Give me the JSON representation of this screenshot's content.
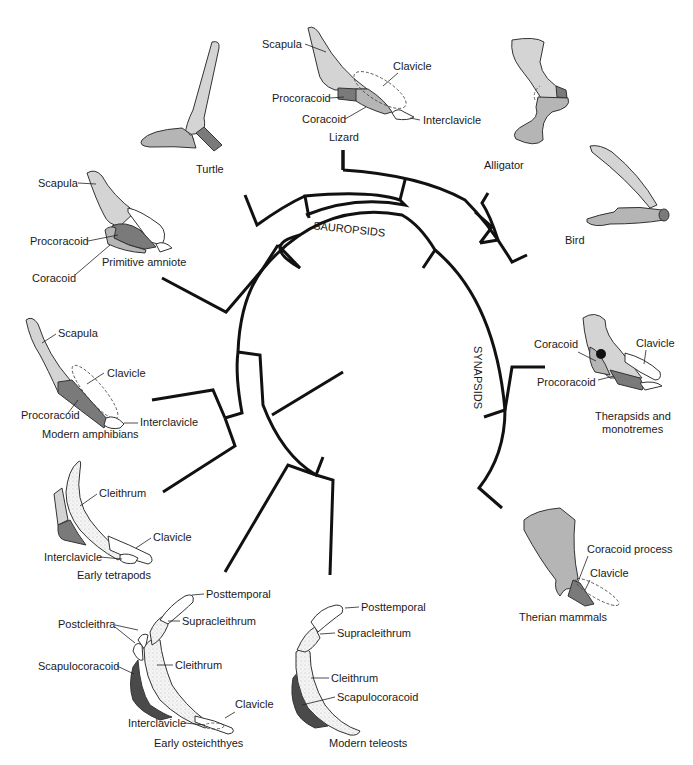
{
  "figure": {
    "clade_labels": {
      "sauropsids": "SAUROPSIDS",
      "synapsids": "SYNAPSIDS"
    },
    "taxa": {
      "turtle": {
        "name": "Turtle"
      },
      "lizard": {
        "name": "Lizard",
        "parts": {
          "scapula": "Scapula",
          "clavicle": "Clavicle",
          "procoracoid": "Procoracoid",
          "coracoid": "Coracoid",
          "interclavicle": "Interclavicle"
        }
      },
      "alligator": {
        "name": "Alligator"
      },
      "bird": {
        "name": "Bird"
      },
      "primitive_amniote": {
        "name": "Primitive amniote",
        "parts": {
          "scapula": "Scapula",
          "procoracoid": "Procoracoid",
          "coracoid": "Coracoid"
        }
      },
      "modern_amphibians": {
        "name": "Modern amphibians",
        "parts": {
          "scapula": "Scapula",
          "clavicle": "Clavicle",
          "procoracoid": "Procoracoid",
          "interclavicle": "Interclavicle"
        }
      },
      "early_tetrapods": {
        "name": "Early tetrapods",
        "parts": {
          "cleithrum": "Cleithrum",
          "clavicle": "Clavicle",
          "interclavicle": "Interclavicle"
        }
      },
      "early_osteichthyes": {
        "name": "Early osteichthyes",
        "parts": {
          "posttemporal": "Posttemporal",
          "postcleithra": "Postcleithra",
          "supracleithrum": "Supracleithrum",
          "scapulocoracoid": "Scapulocoracoid",
          "cleithrum": "Cleithrum",
          "clavicle": "Clavicle",
          "interclavicle": "Interclavicle"
        }
      },
      "modern_teleosts": {
        "name": "Modern teleosts",
        "parts": {
          "posttemporal": "Posttemporal",
          "supracleithrum": "Supracleithrum",
          "cleithrum": "Cleithrum",
          "scapulocoracoid": "Scapulocoracoid"
        }
      },
      "therapsids": {
        "name_line1": "Therapsids and",
        "name_line2": "monotremes",
        "parts": {
          "coracoid": "Coracoid",
          "clavicle": "Clavicle",
          "procoracoid": "Procoracoid"
        }
      },
      "therian_mammals": {
        "name": "Therian mammals",
        "parts": {
          "coracoid_process": "Coracoid process",
          "clavicle": "Clavicle"
        }
      }
    },
    "colors": {
      "background": "#ffffff",
      "tree_line": "#111111",
      "scapula_fill": "#d4d4d4",
      "coracoid_fill": "#b5b5b5",
      "procoracoid_fill": "#7a7a7a",
      "scapulocoracoid_fill": "#4a4a4a",
      "text": "#1a1a1a"
    }
  }
}
